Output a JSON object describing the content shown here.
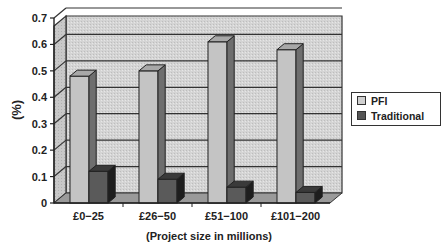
{
  "chart_data": {
    "type": "bar",
    "style": "3d-clustered-column",
    "title": "",
    "xlabel": "(Project size in millions)",
    "ylabel": "(%)",
    "ylim": [
      0,
      0.7
    ],
    "yticks": [
      "0",
      "0.1",
      "0.2",
      "0.3",
      "0.4",
      "0.5",
      "0.6",
      "0.7"
    ],
    "grid": true,
    "legend_position": "right",
    "categories": [
      "£0−25",
      "£26−50",
      "£51−100",
      "£101−200"
    ],
    "series": [
      {
        "name": "PFI",
        "color": "#b8b8b8",
        "values": [
          0.48,
          0.5,
          0.61,
          0.58
        ]
      },
      {
        "name": "Traditional",
        "color": "#555555",
        "values": [
          0.12,
          0.09,
          0.06,
          0.04
        ]
      }
    ]
  },
  "legend": {
    "items": [
      {
        "label": "PFI",
        "color": "#d0d0d0"
      },
      {
        "label": "Traditional",
        "color": "#555555"
      }
    ]
  },
  "axes": {
    "y_title": "(%)",
    "x_title": "(Project size in millions)"
  }
}
